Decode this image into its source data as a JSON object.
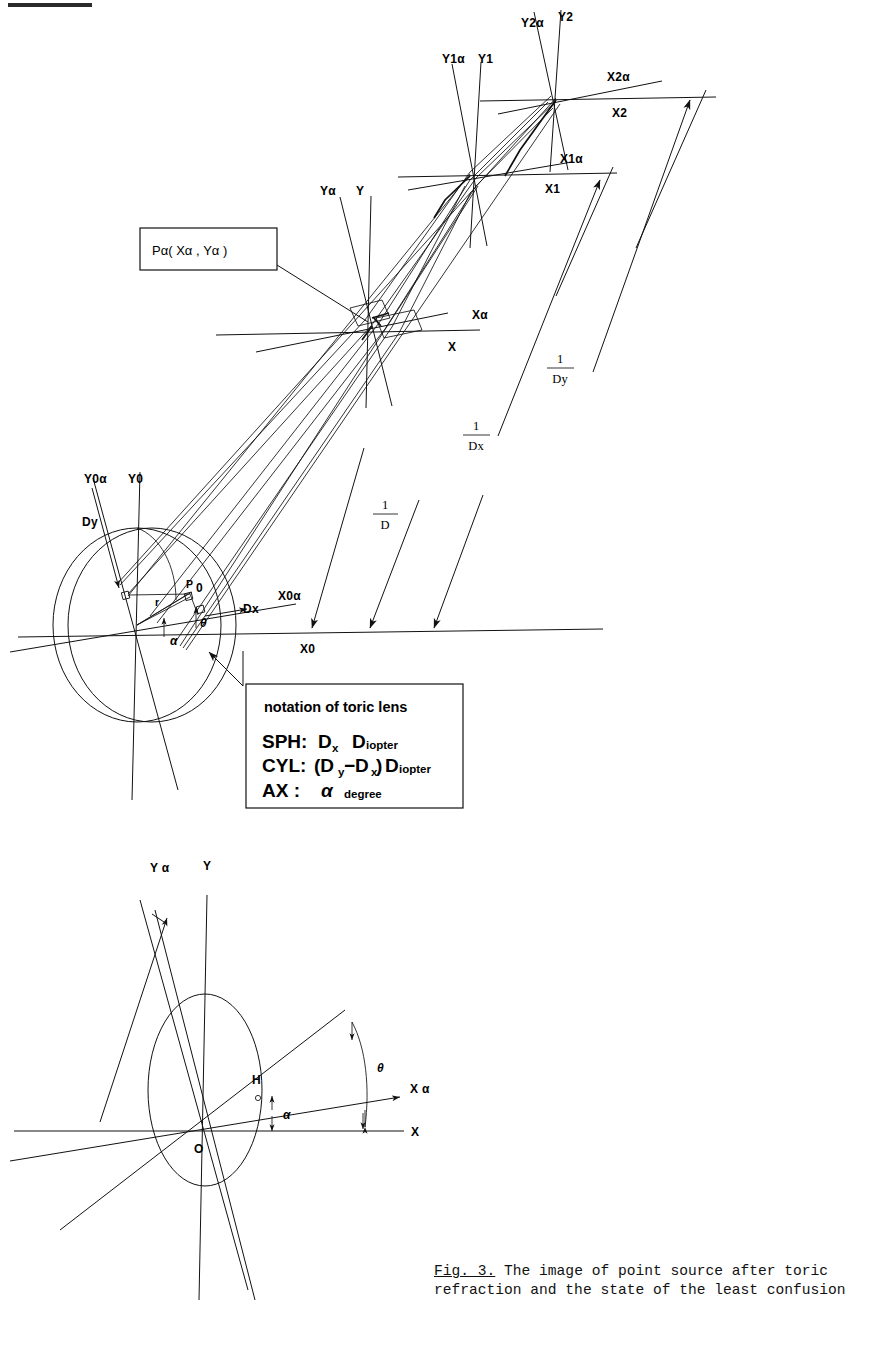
{
  "figure": {
    "caption_prefix": "Fig. 3.",
    "caption_text": " The image of point source after toric refraction and the state of the least confusion"
  },
  "callout": {
    "point_label": "Pα( Xα , Yα )"
  },
  "notation_box": {
    "title": "notation of toric lens",
    "rows": [
      {
        "key": "SPH:",
        "value": "D",
        "sub": "x",
        "unit_big": "D",
        "unit_rest": "iopter"
      },
      {
        "key": "CYL:",
        "value": "(D",
        "sub": "y",
        "value2": "−D",
        "sub2": "x",
        "value3": ")",
        "unit_big": "D",
        "unit_rest": "iopter"
      },
      {
        "key": "AX :",
        "value": "α",
        "unit_rest": "degree"
      }
    ],
    "line1": "SPH:",
    "line2": "CYL:",
    "line3": "AX :"
  },
  "lens_diagram": {
    "axes": [
      {
        "name": "Y0α"
      },
      {
        "name": "Y0"
      },
      {
        "name": "X0α"
      },
      {
        "name": "X0"
      }
    ],
    "vectors": [
      {
        "name": "Dy"
      },
      {
        "name": "Dx"
      }
    ],
    "points": [
      {
        "name": "P₀",
        "display": "P"
      },
      {
        "name": "P0-sub",
        "display": "0"
      }
    ],
    "measures": [
      {
        "name": "r"
      },
      {
        "name": "α"
      },
      {
        "name": "θ"
      }
    ]
  },
  "focal_planes": [
    {
      "id": "plane-alpha",
      "y_alpha": "Yα",
      "y": "Y",
      "x_alpha": "Xα",
      "x": "X",
      "distance_num": "1",
      "distance_den": "D"
    },
    {
      "id": "plane-1",
      "y_alpha": "Y1α",
      "y": "Y1",
      "x_alpha": "X1α",
      "x": "X1",
      "distance_num": "1",
      "distance_den": "Dx"
    },
    {
      "id": "plane-2",
      "y_alpha": "Y2α",
      "y": "Y2",
      "x_alpha": "X2α",
      "x": "X2",
      "distance_num": "1",
      "distance_den": "Dy"
    }
  ],
  "lower_diagram": {
    "y_alpha": "Y α",
    "y": "Y",
    "x_alpha": "X α",
    "x": "X",
    "origin": "O",
    "foot": "H",
    "angle_alpha": "α",
    "angle_theta": "θ"
  },
  "colors": {
    "ink": "#111111",
    "paper": "#ffffff"
  }
}
